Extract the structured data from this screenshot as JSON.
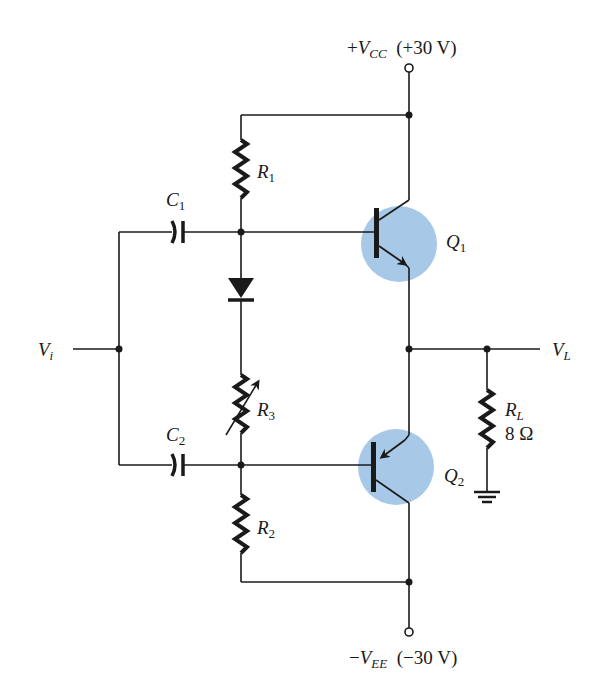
{
  "figure": {
    "type": "Class B quasi-complementary push-pull amplifier schematic",
    "colors": {
      "wire": "#1a1a1a",
      "transistor_highlight": "#a8c8e8",
      "background": "#ffffff"
    }
  },
  "supply": {
    "vcc": {
      "sign": "+",
      "symbol": "V",
      "subscript": "CC",
      "value": "(+30 V)"
    },
    "vee": {
      "sign": "−",
      "symbol": "V",
      "subscript": "EE",
      "value": "(−30 V)"
    }
  },
  "input": {
    "symbol": "V",
    "subscript": "i"
  },
  "output": {
    "symbol": "V",
    "subscript": "L"
  },
  "components": {
    "r1": {
      "symbol": "R",
      "subscript": "1",
      "kind": "resistor"
    },
    "r2": {
      "symbol": "R",
      "subscript": "2",
      "kind": "resistor"
    },
    "r3": {
      "symbol": "R",
      "subscript": "3",
      "kind": "variable-resistor"
    },
    "rl": {
      "symbol": "R",
      "subscript": "L",
      "value": "8 Ω",
      "kind": "load-resistor"
    },
    "c1": {
      "symbol": "C",
      "subscript": "1",
      "kind": "capacitor"
    },
    "c2": {
      "symbol": "C",
      "subscript": "2",
      "kind": "capacitor"
    },
    "d1": {
      "kind": "diode"
    },
    "q1": {
      "symbol": "Q",
      "subscript": "1",
      "kind": "npn-transistor"
    },
    "q2": {
      "symbol": "Q",
      "subscript": "2",
      "kind": "pnp-transistor"
    },
    "ground": {
      "kind": "ground"
    }
  }
}
